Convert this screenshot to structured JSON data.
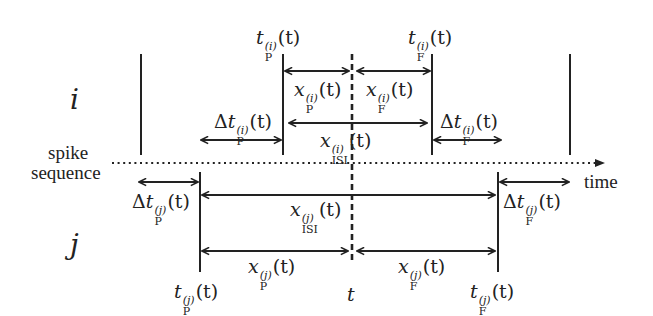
{
  "diagram": {
    "type": "spike-timing-diagram",
    "rows": {
      "i": {
        "label": "i"
      },
      "j": {
        "label": "j"
      }
    },
    "axis": {
      "label_line1": "spike",
      "label_line2": "sequence",
      "time_label": "time"
    },
    "current_time_label": "t",
    "labels": {
      "i_tP": {
        "base": "t",
        "sup": "(i)",
        "sub": "P",
        "arg": "(t)",
        "prefix": ""
      },
      "i_tF": {
        "base": "t",
        "sup": "(i)",
        "sub": "F",
        "arg": "(t)",
        "prefix": ""
      },
      "i_xP": {
        "base": "x",
        "sup": "(i)",
        "sub": "P",
        "arg": "(t)",
        "prefix": ""
      },
      "i_xF": {
        "base": "x",
        "sup": "(i)",
        "sub": "F",
        "arg": "(t)",
        "prefix": ""
      },
      "i_dtP": {
        "base": "t",
        "sup": "(i)",
        "sub": "P",
        "arg": "(t)",
        "prefix": "Δ"
      },
      "i_dtF": {
        "base": "t",
        "sup": "(i)",
        "sub": "F",
        "arg": "(t)",
        "prefix": "Δ"
      },
      "i_xISI": {
        "base": "x",
        "sup": "(i)",
        "sub": "ISI",
        "arg": "(t)",
        "prefix": ""
      },
      "j_dtP": {
        "base": "t",
        "sup": "(j)",
        "sub": "P",
        "arg": "(t)",
        "prefix": "Δ"
      },
      "j_dtF": {
        "base": "t",
        "sup": "(j)",
        "sub": "F",
        "arg": "(t)",
        "prefix": "Δ"
      },
      "j_xISI": {
        "base": "x",
        "sup": "(j)",
        "sub": "ISI",
        "arg": "(t)",
        "prefix": ""
      },
      "j_xP": {
        "base": "x",
        "sup": "(j)",
        "sub": "P",
        "arg": "(t)",
        "prefix": ""
      },
      "j_xF": {
        "base": "x",
        "sup": "(j)",
        "sub": "F",
        "arg": "(t)",
        "prefix": ""
      },
      "j_tP": {
        "base": "t",
        "sup": "(j)",
        "sub": "P",
        "arg": "(t)",
        "prefix": ""
      },
      "j_tF": {
        "base": "t",
        "sup": "(j)",
        "sub": "F",
        "arg": "(t)",
        "prefix": ""
      }
    },
    "colors": {
      "ink": "#222222",
      "background": "#ffffff"
    }
  }
}
